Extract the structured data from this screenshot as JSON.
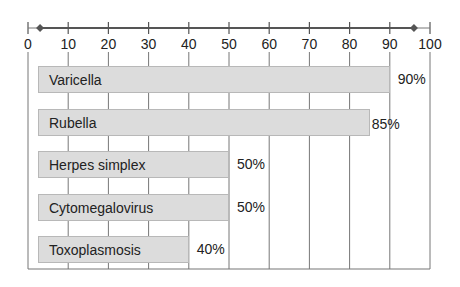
{
  "chart_data": {
    "type": "bar",
    "orientation": "horizontal",
    "title": "",
    "xlabel": "",
    "ylabel": "",
    "xlim": [
      0,
      100
    ],
    "x_ticks": [
      "0",
      "10",
      "20",
      "30",
      "40",
      "50",
      "60",
      "70",
      "80",
      "90",
      "100"
    ],
    "grid": true,
    "categories": [
      "Varicella",
      "Rubella",
      "Herpes simplex",
      "Cytomegalovirus",
      "Toxoplasmosis"
    ],
    "values": [
      90,
      85,
      50,
      50,
      40
    ],
    "value_labels": [
      "90%",
      "85%",
      "50%",
      "50%",
      "40%"
    ],
    "bar_color": "#dcdcdc",
    "axis_markers": [
      3,
      96
    ]
  }
}
